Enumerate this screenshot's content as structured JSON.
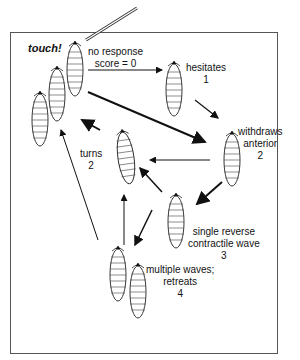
{
  "diagram": {
    "stimulus_label": "touch!",
    "states": [
      {
        "id": "no-response",
        "label_lines": [
          "no response",
          "score = 0"
        ]
      },
      {
        "id": "hesitates",
        "label_lines": [
          "hesitates",
          "1"
        ]
      },
      {
        "id": "withdraws-anterior",
        "label_lines": [
          "withdraws",
          "anterior",
          "2"
        ]
      },
      {
        "id": "turns",
        "label_lines": [
          "turns",
          "2"
        ]
      },
      {
        "id": "single-reverse",
        "label_lines": [
          "single reverse",
          "contractile wave",
          "3"
        ]
      },
      {
        "id": "multiple-waves",
        "label_lines": [
          "multiple waves;",
          "retreats",
          "4"
        ]
      }
    ],
    "transitions": [
      {
        "from": "no-response",
        "to": "hesitates"
      },
      {
        "from": "no-response",
        "to": "withdraws-anterior"
      },
      {
        "from": "hesitates",
        "to": "withdraws-anterior"
      },
      {
        "from": "withdraws-anterior",
        "to": "turns"
      },
      {
        "from": "withdraws-anterior",
        "to": "single-reverse"
      },
      {
        "from": "single-reverse",
        "to": "turns"
      },
      {
        "from": "single-reverse",
        "to": "multiple-waves"
      },
      {
        "from": "turns",
        "to": "no-response"
      },
      {
        "from": "multiple-waves",
        "to": "turns"
      },
      {
        "from": "multiple-waves",
        "to": "no-response"
      }
    ]
  }
}
